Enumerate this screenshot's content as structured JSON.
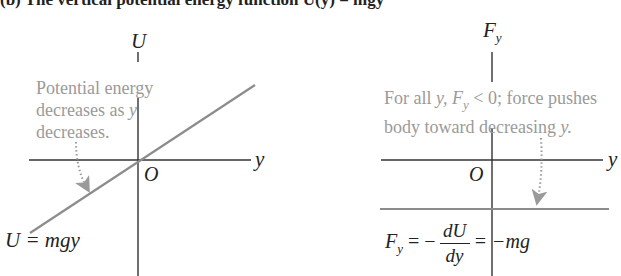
{
  "heading": "(b) The vertical potential energy function U(y) = mgy",
  "left_panel": {
    "axis_vertical_label": "U",
    "axis_horizontal_label": "y",
    "origin_label": "O",
    "note_lines": [
      "Potential energy",
      "decreases as ",
      "decreases."
    ],
    "note_var": "y",
    "equation": "U = mgy",
    "colors": {
      "axis": "#333333",
      "curve": "#8c8c8c",
      "note": "#9a9a9a"
    }
  },
  "right_panel": {
    "axis_vertical_label": "F",
    "axis_vertical_sub": "y",
    "axis_horizontal_label": "y",
    "origin_label": "O",
    "note_line1_prefix": "For all ",
    "note_line1_var": "y, F",
    "note_line1_sub": "y",
    "note_line1_suffix": " < 0; force pushes",
    "note_line2_prefix": "body toward decreasing ",
    "note_line2_var": "y.",
    "equation_lhs": "F",
    "equation_lhs_sub": "y",
    "equation_mid": " = −",
    "frac_num": "dU",
    "frac_den": "dy",
    "equation_rhs": "= −mg",
    "colors": {
      "axis": "#333333",
      "curve": "#8c8c8c",
      "note": "#9a9a9a"
    }
  }
}
